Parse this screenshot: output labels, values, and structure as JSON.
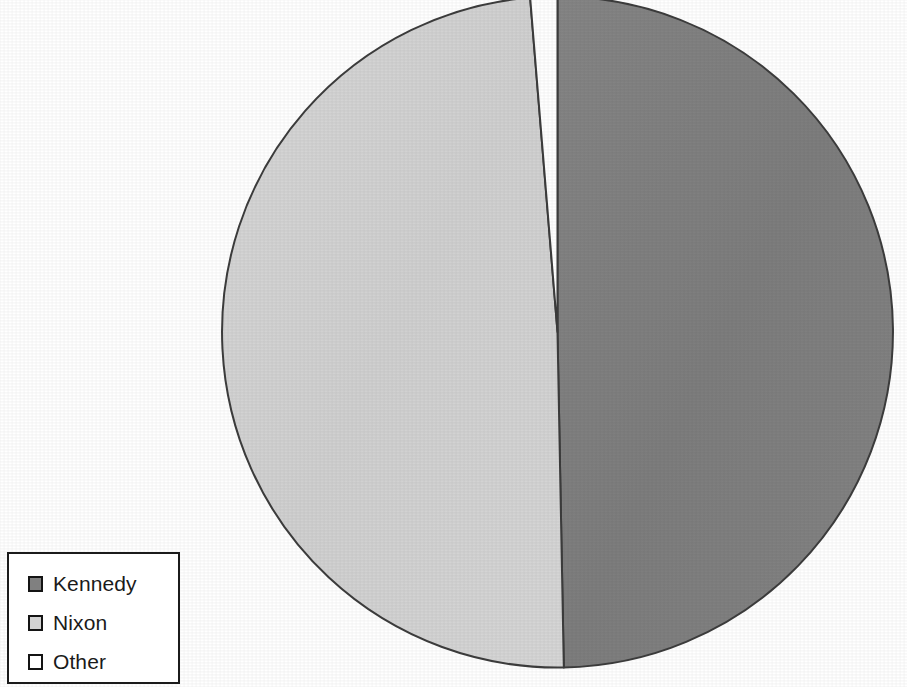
{
  "chart_data": {
    "type": "pie",
    "title": "",
    "subtitle": "",
    "xlabel": "",
    "ylabel": "",
    "grid": false,
    "legend_position": "bottom-left",
    "start_angle_deg": 0,
    "direction": "clockwise",
    "categories": [
      "Kennedy",
      "Nixon",
      "Other"
    ],
    "values": [
      49.7,
      49.0,
      1.3
    ],
    "colors": [
      "#808080",
      "#d3d3d3",
      "#ffffff"
    ],
    "slices": [
      {
        "label": "Kennedy",
        "value": 49.7,
        "color": "#808080"
      },
      {
        "label": "Nixon",
        "value": 49.0,
        "color": "#d3d3d3"
      },
      {
        "label": "Other",
        "value": 1.3,
        "color": "#ffffff"
      }
    ],
    "annotations": []
  },
  "legend": {
    "items": [
      {
        "label": "Kennedy",
        "color": "#808080"
      },
      {
        "label": "Nixon",
        "color": "#d3d3d3"
      },
      {
        "label": "Other",
        "color": "#ffffff"
      }
    ]
  },
  "style": {
    "background": "#ffffff",
    "outline": "#3c3c3c",
    "legend_border": "#1b1b1b",
    "kennedy_color": "#808080",
    "nixon_color": "#d3d3d3",
    "other_color": "#ffffff"
  }
}
